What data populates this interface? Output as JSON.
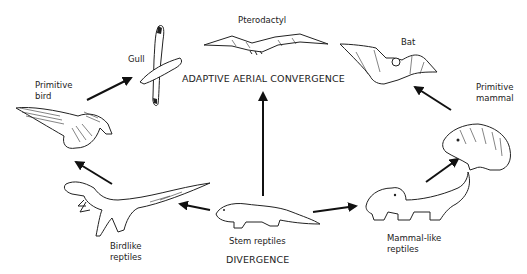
{
  "diagram": {
    "title_top": "ADAPTIVE AERIAL CONVERGENCE",
    "title_bottom": "DIVERGENCE",
    "nodes": {
      "stem_reptiles": {
        "label": "Stem reptiles"
      },
      "birdlike_reptiles": {
        "label_line1": "Birdlike",
        "label_line2": "reptiles"
      },
      "primitive_bird": {
        "label_line1": "Primitive",
        "label_line2": "bird"
      },
      "gull": {
        "label": "Gull"
      },
      "pterodactyl": {
        "label": "Pterodactyl"
      },
      "bat": {
        "label": "Bat"
      },
      "primitive_mammal": {
        "label_line1": "Primitive",
        "label_line2": "mammal"
      },
      "mammal_like_reptiles": {
        "label_line1": "Mammal-like",
        "label_line2": "reptiles"
      }
    },
    "edges": [
      {
        "from": "Stem reptiles",
        "to": "Birdlike reptiles"
      },
      {
        "from": "Birdlike reptiles",
        "to": "Primitive bird"
      },
      {
        "from": "Primitive bird",
        "to": "Gull"
      },
      {
        "from": "Stem reptiles",
        "to": "Pterodactyl"
      },
      {
        "from": "Stem reptiles",
        "to": "Mammal-like reptiles"
      },
      {
        "from": "Mammal-like reptiles",
        "to": "Primitive mammal"
      },
      {
        "from": "Primitive mammal",
        "to": "Bat"
      }
    ]
  }
}
